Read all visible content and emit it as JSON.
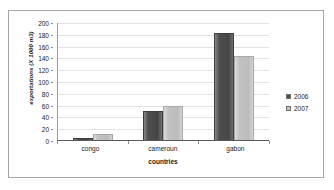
{
  "chart_data": {
    "type": "bar",
    "title": "",
    "subtitle": "",
    "xlabel": "countries",
    "ylabel": "exportations (X 1000 m3)",
    "categories": [
      "congo",
      "cameroun",
      "gabon"
    ],
    "series": [
      {
        "name": "2006",
        "values": [
          3,
          50,
          182
        ],
        "color": "#4f4f4f"
      },
      {
        "name": "2007",
        "values": [
          10,
          57,
          143
        ],
        "color": "#c2c2c2"
      }
    ],
    "ylim": [
      0,
      200
    ],
    "ytick_step": 20,
    "yticks": [
      "0",
      "20",
      "40",
      "60",
      "80",
      "100",
      "120",
      "140",
      "160",
      "180",
      "200"
    ],
    "grid": true,
    "legend_position": "right",
    "frame": true,
    "annotations": []
  },
  "legend": {
    "items": [
      {
        "label": "2006",
        "swatch": "dark-gray-swatch"
      },
      {
        "label": "2007",
        "swatch": "light-gray-swatch"
      }
    ]
  },
  "colors": {
    "series_2006": "#4f4f4f",
    "series_2007": "#c2c2c2",
    "gridline": "#e3e3e3",
    "axis": "#5a5a5a",
    "frame_border": "#a6a6a6",
    "text": "#1a1a1a",
    "background": "#ffffff"
  }
}
